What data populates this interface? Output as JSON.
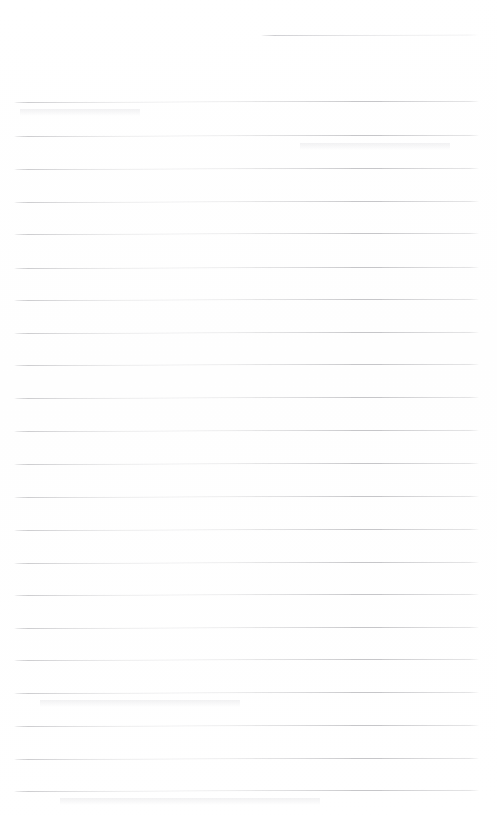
{
  "document": {
    "kind": "scanned-ruled-paper",
    "title": "Blank ruled writing sheet",
    "page_width": 497,
    "page_height": 816,
    "background_color": "#ffffff",
    "rule_color": "#c6c6c9",
    "header_rule_color": "#ccccd0",
    "rule_thickness_px": 1,
    "rule_spacing_px": 32.7,
    "scan_tilt_degrees": -0.16,
    "text_content": "",
    "visible_text": "none — the sheet is blank",
    "rules": [
      {
        "index": 1,
        "role": "header-rule",
        "x": 261,
        "y": 35,
        "width": 217
      },
      {
        "index": 2,
        "role": "body-rule",
        "x": 14,
        "y": 102,
        "width": 465
      },
      {
        "index": 3,
        "role": "body-rule",
        "x": 14,
        "y": 136,
        "width": 465
      },
      {
        "index": 4,
        "role": "body-rule",
        "x": 14,
        "y": 169,
        "width": 465
      },
      {
        "index": 5,
        "role": "body-rule",
        "x": 14,
        "y": 202,
        "width": 465
      },
      {
        "index": 6,
        "role": "body-rule",
        "x": 14,
        "y": 234,
        "width": 465
      },
      {
        "index": 7,
        "role": "body-rule",
        "x": 14,
        "y": 268,
        "width": 465
      },
      {
        "index": 8,
        "role": "body-rule",
        "x": 14,
        "y": 300,
        "width": 465
      },
      {
        "index": 9,
        "role": "body-rule",
        "x": 14,
        "y": 333,
        "width": 465
      },
      {
        "index": 10,
        "role": "body-rule",
        "x": 14,
        "y": 365,
        "width": 465
      },
      {
        "index": 11,
        "role": "body-rule",
        "x": 14,
        "y": 398,
        "width": 465
      },
      {
        "index": 12,
        "role": "body-rule",
        "x": 14,
        "y": 431,
        "width": 465
      },
      {
        "index": 13,
        "role": "body-rule",
        "x": 14,
        "y": 464,
        "width": 465
      },
      {
        "index": 14,
        "role": "body-rule",
        "x": 14,
        "y": 497,
        "width": 465
      },
      {
        "index": 15,
        "role": "body-rule",
        "x": 14,
        "y": 530,
        "width": 465
      },
      {
        "index": 16,
        "role": "body-rule",
        "x": 14,
        "y": 563,
        "width": 465
      },
      {
        "index": 17,
        "role": "body-rule",
        "x": 14,
        "y": 595,
        "width": 465
      },
      {
        "index": 18,
        "role": "body-rule",
        "x": 14,
        "y": 628,
        "width": 465
      },
      {
        "index": 19,
        "role": "body-rule",
        "x": 14,
        "y": 660,
        "width": 465
      },
      {
        "index": 20,
        "role": "body-rule",
        "x": 14,
        "y": 693,
        "width": 465
      },
      {
        "index": 21,
        "role": "body-rule",
        "x": 14,
        "y": 726,
        "width": 465
      },
      {
        "index": 22,
        "role": "body-rule",
        "x": 14,
        "y": 759,
        "width": 465
      },
      {
        "index": 23,
        "role": "body-rule",
        "x": 14,
        "y": 791,
        "width": 465
      }
    ],
    "smudges": [
      {
        "x": 20,
        "y": 109,
        "width": 120
      },
      {
        "x": 300,
        "y": 143,
        "width": 150
      },
      {
        "x": 40,
        "y": 700,
        "width": 200
      },
      {
        "x": 60,
        "y": 798,
        "width": 260
      }
    ]
  }
}
